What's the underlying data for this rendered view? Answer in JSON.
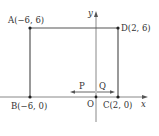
{
  "diagram": {
    "axes": {
      "x_label": "x",
      "y_label": "y",
      "origin_label": "O"
    },
    "points": [
      {
        "id": "A",
        "label": "A(−6, 6)",
        "x": -6,
        "y": 6
      },
      {
        "id": "B",
        "label": "B(−6, 0)",
        "x": -6,
        "y": 0
      },
      {
        "id": "C",
        "label": "C(2, 0)",
        "x": 2,
        "y": 0
      },
      {
        "id": "D",
        "label": "D(2, 6)",
        "x": 2,
        "y": 6
      }
    ],
    "movers": [
      {
        "id": "P",
        "label": "P",
        "direction": "left"
      },
      {
        "id": "Q",
        "label": "Q",
        "direction": "right"
      }
    ],
    "colors": {
      "line": "#555555",
      "axis": "#888888",
      "text": "#333333"
    }
  }
}
